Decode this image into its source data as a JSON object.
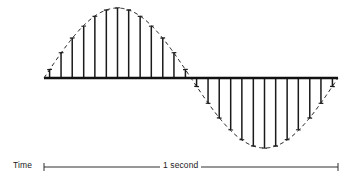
{
  "figure": {
    "type": "sampled-sine-waveform-diagram",
    "background_color": "#ffffff",
    "stroke_color": "#1a1a1a",
    "envelope_style": "dashed",
    "baseline_color": "#111111"
  },
  "axis": {
    "time_label": "Time",
    "duration_label": "1 second",
    "tick_cap_style": "serif-end-cap",
    "bar_start_x": 44,
    "bar_end_x": 338,
    "bar_y": 167
  },
  "chart_data": {
    "type": "line",
    "title": "",
    "subtitle": "",
    "xlabel": "Time",
    "ylabel": "",
    "annotations": [
      "Time",
      "1 second"
    ],
    "grid": false,
    "legend": null,
    "xlim": [
      0,
      1
    ],
    "ylim": [
      -1,
      1
    ],
    "x_units": "seconds",
    "period_seconds": 1,
    "cycles_shown": 1,
    "amplitude": 1,
    "baseline_value": 0,
    "envelope": {
      "name": "sine envelope (dashed)",
      "formula": "y = sin(2*pi*t)",
      "style": "dashed",
      "x_start": 44,
      "x_end": 338
    },
    "series": [
      {
        "name": "samples",
        "style": "vertical-bars-with-top-caps",
        "sample_count": 26,
        "x": [
          0.019,
          0.058,
          0.096,
          0.135,
          0.173,
          0.212,
          0.25,
          0.288,
          0.327,
          0.365,
          0.404,
          0.442,
          0.481,
          0.519,
          0.558,
          0.596,
          0.635,
          0.673,
          0.712,
          0.75,
          0.788,
          0.827,
          0.865,
          0.904,
          0.942,
          0.981
        ],
        "values": [
          0.12,
          0.36,
          0.57,
          0.74,
          0.88,
          0.97,
          1.0,
          0.97,
          0.88,
          0.74,
          0.57,
          0.36,
          0.12,
          -0.12,
          -0.36,
          -0.57,
          -0.74,
          -0.88,
          -0.97,
          -1.0,
          -0.97,
          -0.88,
          -0.74,
          -0.57,
          -0.36,
          -0.12
        ]
      }
    ]
  }
}
